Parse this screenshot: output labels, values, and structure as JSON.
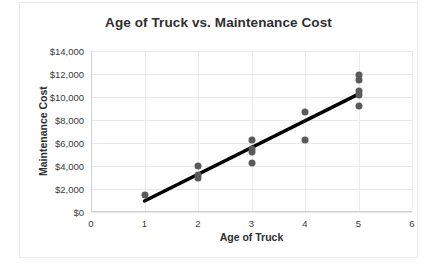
{
  "chart_data": {
    "type": "scatter",
    "title": "Age of Truck vs. Maintenance Cost",
    "xlabel": "Age of Truck",
    "ylabel": "Maintenance Cost",
    "xlim": [
      0,
      6
    ],
    "ylim": [
      0,
      14000
    ],
    "xticks": [
      0,
      1,
      2,
      3,
      4,
      5,
      6
    ],
    "xtick_labels": [
      "0",
      "1",
      "2",
      "3",
      "4",
      "5",
      "6"
    ],
    "yticks": [
      0,
      2000,
      4000,
      6000,
      8000,
      10000,
      12000,
      14000
    ],
    "ytick_labels": [
      "$0",
      "$2,000",
      "$4,000",
      "$6,000",
      "$8,000",
      "$10,000",
      "$12,000",
      "$14,000"
    ],
    "grid": true,
    "legend": false,
    "marker_color": "#5a5a5a",
    "trendline_color": "#000000",
    "series": [
      {
        "name": "Maintenance Cost",
        "x": [
          1,
          2,
          2,
          2,
          3,
          3,
          3,
          3,
          4,
          4,
          5,
          5,
          5,
          5,
          5
        ],
        "y": [
          1450,
          4000,
          3200,
          3000,
          6300,
          5500,
          5200,
          4300,
          8700,
          6300,
          11900,
          11500,
          10500,
          10200,
          9250
        ]
      }
    ],
    "trendline": {
      "name": "Linear trendline",
      "x": [
        1,
        5
      ],
      "y": [
        950,
        10250
      ]
    }
  }
}
